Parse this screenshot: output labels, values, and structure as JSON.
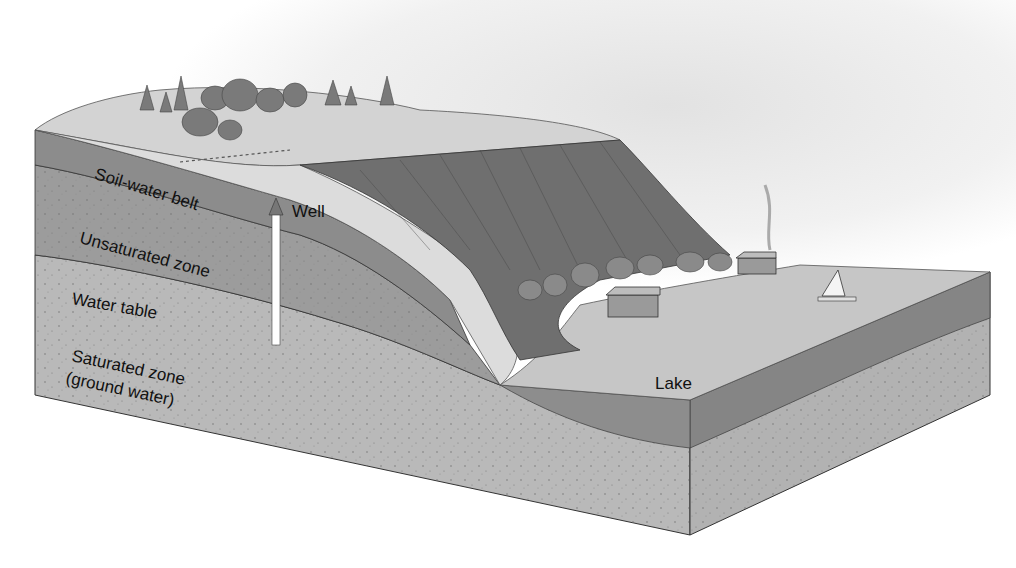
{
  "diagram": {
    "labels": {
      "soil_water_belt": "Soil-water belt",
      "unsaturated_zone": "Unsaturated zone",
      "water_table": "Water table",
      "saturated_zone_line1": "Saturated zone",
      "saturated_zone_line2": "(ground water)",
      "well": "Well",
      "lake": "Lake"
    },
    "colors": {
      "background": "#ffffff",
      "sky": "#efefef",
      "soil_belt": "#8e8e8e",
      "unsaturated": "#9a9a9a",
      "saturated": "#b9b9b9",
      "lake_surface": "#c4c4c4",
      "lake_section": "#8a8a8a",
      "cliff": "#6e6e6e",
      "plateau": "#cfcfcf",
      "well_pipe": "#ffffff",
      "outline": "#333333"
    }
  }
}
